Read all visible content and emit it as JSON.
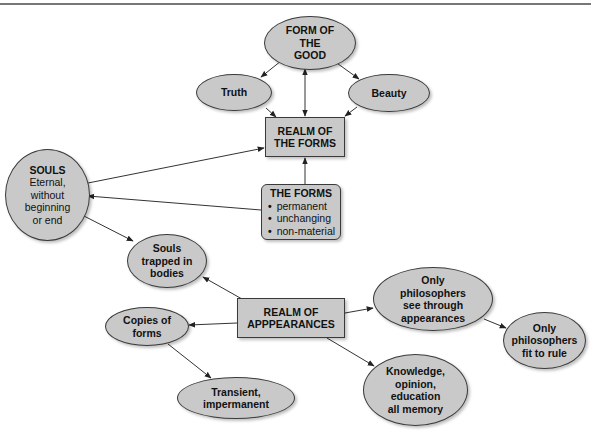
{
  "diagram": {
    "colors": {
      "node_fill": "#c9c9c9",
      "node_border": "#3a3a3a",
      "line": "#333333",
      "rule": "#777777"
    },
    "nodes": {
      "form_of_good": {
        "lines": [
          "FORM OF",
          "THE",
          "GOOD"
        ]
      },
      "truth": {
        "label": "Truth"
      },
      "beauty": {
        "label": "Beauty"
      },
      "realm_forms": {
        "lines": [
          "REALM OF",
          "THE FORMS"
        ]
      },
      "souls": {
        "title": "SOULS",
        "lines": [
          "Eternal,",
          "without",
          "beginning",
          "or end"
        ]
      },
      "the_forms": {
        "title": "THE FORMS",
        "bullets": [
          "permanent",
          "unchanging",
          "non-material"
        ]
      },
      "souls_trapped": {
        "lines": [
          "Souls",
          "trapped in",
          "bodies"
        ]
      },
      "realm_appearances": {
        "lines": [
          "REALM OF",
          "APPPEARANCES"
        ]
      },
      "copies": {
        "lines": [
          "Copies of",
          "forms"
        ]
      },
      "transient": {
        "lines": [
          "Transient,",
          "impermanent"
        ]
      },
      "philosophers_see": {
        "lines": [
          "Only",
          "philosophers",
          "see through",
          "appearances"
        ]
      },
      "philosophers_rule": {
        "lines": [
          "Only",
          "philosophers",
          "fit to rule"
        ]
      },
      "knowledge": {
        "lines": [
          "Knowledge,",
          "opinion,",
          "education",
          "all memory"
        ]
      }
    },
    "edges": [
      {
        "from": "form_of_good",
        "to": "truth"
      },
      {
        "from": "form_of_good",
        "to": "beauty"
      },
      {
        "from": "form_of_good",
        "to": "realm_forms",
        "bidirectional": true
      },
      {
        "from": "truth",
        "to": "realm_forms"
      },
      {
        "from": "beauty",
        "to": "realm_forms"
      },
      {
        "from": "souls",
        "to": "realm_forms"
      },
      {
        "from": "the_forms",
        "to": "realm_forms"
      },
      {
        "from": "the_forms",
        "to": "souls"
      },
      {
        "from": "souls",
        "to": "souls_trapped"
      },
      {
        "from": "realm_appearances",
        "to": "souls_trapped"
      },
      {
        "from": "realm_appearances",
        "to": "copies"
      },
      {
        "from": "copies",
        "to": "transient"
      },
      {
        "from": "realm_appearances",
        "to": "philosophers_see"
      },
      {
        "from": "philosophers_see",
        "to": "philosophers_rule"
      },
      {
        "from": "realm_appearances",
        "to": "knowledge"
      }
    ]
  }
}
